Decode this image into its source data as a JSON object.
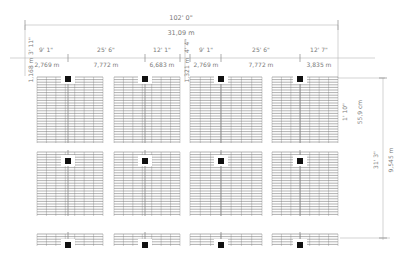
{
  "overall_dimension": {
    "imperial": "102' 0\"",
    "metric": "31,09 m"
  },
  "top_segments": [
    {
      "imperial": "9' 1\"",
      "metric": "2,769 m"
    },
    {
      "imperial": "25' 6\"",
      "metric": "7,772 m"
    },
    {
      "imperial": "12' 1\"",
      "metric": "6,683 m"
    },
    {
      "imperial": "9' 1\"",
      "metric": "2,769 m"
    },
    {
      "imperial": "25' 6\"",
      "metric": "7,772 m"
    },
    {
      "imperial": "12' 7\"",
      "metric": "3,835 m"
    }
  ],
  "left_vertical": {
    "imperial": "3' 11\"",
    "metric": "1,168 m"
  },
  "middle_vertical": {
    "imperial": "4' 4\"",
    "metric": "1,321 m"
  },
  "right_verticals": [
    {
      "imperial": "1' 10\"",
      "metric": "55,9 cm"
    },
    {
      "imperial": "31' 3\"",
      "metric": "9,545 m"
    }
  ],
  "layout": {
    "bays_x": [
      [
        37,
        103
      ],
      [
        114,
        180
      ],
      [
        190,
        262
      ],
      [
        272,
        338
      ]
    ],
    "rows_y": [
      [
        77,
        143
      ],
      [
        152,
        216
      ],
      [
        234,
        246
      ]
    ],
    "column_x": [
      68,
      145,
      221,
      300
    ],
    "line_color": "#6e6e6e",
    "column_color": "#111111"
  }
}
